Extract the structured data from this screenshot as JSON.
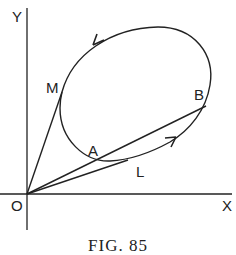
{
  "figure": {
    "caption": "FIG. 85",
    "labels": {
      "y_axis": "Y",
      "x_axis": "X",
      "origin": "O",
      "point_m": "M",
      "point_b": "B",
      "point_a": "A",
      "point_l": "L"
    },
    "colors": {
      "stroke": "#222222",
      "background": "#ffffff"
    }
  }
}
